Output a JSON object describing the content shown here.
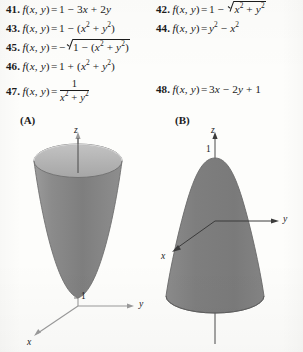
{
  "page": {
    "background_color": "#fdfdfb",
    "ink_color": "#1b1b1b"
  },
  "exercises": [
    {
      "number": "41.",
      "function_name": "f",
      "arguments": "(x, y)",
      "equals": "=",
      "expression_plain": "1 - 3x + 2y",
      "column": 1
    },
    {
      "number": "42.",
      "function_name": "f",
      "arguments": "(x, y)",
      "equals": "=",
      "expression_plain": "1 - sqrt(x^2 + y^2)",
      "column": 2
    },
    {
      "number": "43.",
      "function_name": "f",
      "arguments": "(x, y)",
      "equals": "=",
      "expression_plain": "1 - (x^2 + y^2)",
      "column": 1
    },
    {
      "number": "44.",
      "function_name": "f",
      "arguments": "(x, y)",
      "equals": "=",
      "expression_plain": "y^2 - x^2",
      "column": 2
    },
    {
      "number": "45.",
      "function_name": "f",
      "arguments": "(x, y)",
      "equals": "=",
      "expression_plain": "-sqrt(1 - (x^2 + y^2))",
      "column": 1
    },
    {
      "number": "46.",
      "function_name": "f",
      "arguments": "(x, y)",
      "equals": "=",
      "expression_plain": "1 + (x^2 + y^2)",
      "column": 1
    },
    {
      "number": "47.",
      "function_name": "f",
      "arguments": "(x, y)",
      "equals": "=",
      "expression_plain": "1 / (x^2 + y^2)",
      "numerator": "1",
      "denominator": "x^2 + y^2",
      "column": 1
    },
    {
      "number": "48.",
      "function_name": "f",
      "arguments": "(x, y)",
      "equals": "=",
      "expression_plain": "3x - 2y + 1",
      "column": 2
    }
  ],
  "figures": [
    {
      "label": "(A)",
      "description": "upward-opening circular paraboloid / cone with open elliptical rim at top, vertex at z = 1 on positive z-axis near origin",
      "axes": {
        "z_label": "z",
        "y_label": "y",
        "x_label": "x"
      },
      "tick_labels": [
        "1"
      ],
      "surface_fill": "#868686",
      "surface_interior_fill": "#b4b4b4",
      "surface_edge": "#6f6f6f",
      "axis_color": "#9a9a9a"
    },
    {
      "label": "(B)",
      "description": "downward-opening circular cone / paraboloid with apex at z = 1, widening toward the bottom, solid gray shading",
      "axes": {
        "z_label": "z",
        "y_label": "y",
        "x_label": "x"
      },
      "tick_labels": [
        "1"
      ],
      "surface_fill": "#808080",
      "surface_edge": "#6a6a6a",
      "axis_color": "#4a4a4a"
    }
  ]
}
